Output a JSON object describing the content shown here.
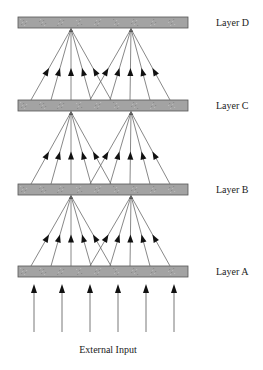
{
  "diagram": {
    "type": "layered-feedforward-network",
    "layers": [
      {
        "id": "D",
        "label": "Layer D",
        "bar_y": 17
      },
      {
        "id": "C",
        "label": "Layer C",
        "bar_y": 100
      },
      {
        "id": "B",
        "label": "Layer B",
        "bar_y": 184
      },
      {
        "id": "A",
        "label": "Layer A",
        "bar_y": 266
      }
    ],
    "bar": {
      "x": 18,
      "width": 170,
      "height": 11,
      "fill": "#a3a3a3",
      "stroke": "#555555"
    },
    "label_x": 216,
    "fan_groups": [
      {
        "apex_x": 71,
        "source_xs": [
          31,
          51,
          71,
          91,
          111
        ]
      },
      {
        "apex_x": 131,
        "source_xs": [
          90,
          110,
          130,
          150,
          170
        ]
      }
    ],
    "connections_description": "Each layer projects upward to the next via two fan-in groups of 5 arrows converging on two units",
    "external_input": {
      "label": "External Input",
      "arrow_xs": [
        34,
        62,
        90,
        118,
        146,
        174
      ],
      "arrow_top_y": 284,
      "arrow_bottom_y": 332
    },
    "colors": {
      "line": "#6a6a6a",
      "arrowhead": "#111111",
      "bar": "#a3a3a3",
      "text": "#222222"
    }
  }
}
